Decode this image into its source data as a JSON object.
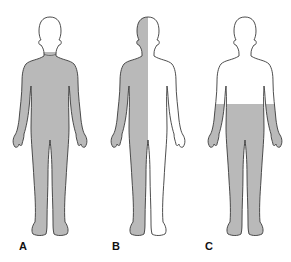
{
  "figures": [
    {
      "label": "A",
      "shading": "whole-body-except-head",
      "center_x": 50
    },
    {
      "label": "B",
      "shading": "left-half-of-body",
      "center_x": 148
    },
    {
      "label": "C",
      "shading": "below-waist",
      "center_x": 245
    }
  ],
  "colors": {
    "fill": "#b9b9b9",
    "outline": "#3a3a3a",
    "background": "#ffffff"
  }
}
